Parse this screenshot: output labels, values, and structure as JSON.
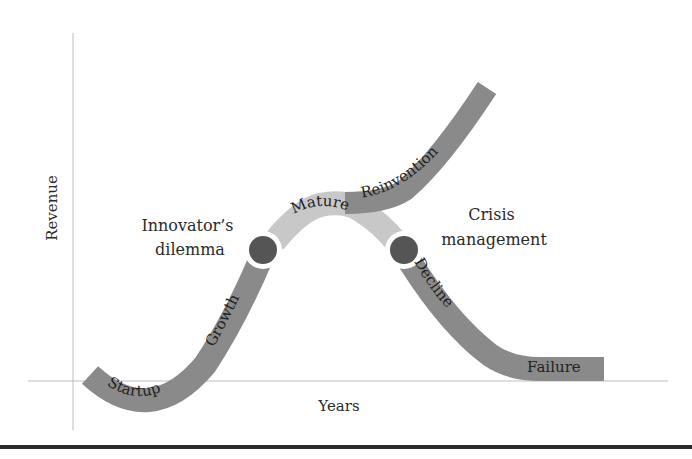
{
  "diagram": {
    "type": "lifecycle-curve",
    "axes": {
      "x_label": "Years",
      "y_label": "Revenue"
    },
    "stages": [
      {
        "id": "startup",
        "label": "Startup"
      },
      {
        "id": "growth",
        "label": "Growth"
      },
      {
        "id": "mature",
        "label": "Mature"
      },
      {
        "id": "reinvention",
        "label": "Reinvention"
      },
      {
        "id": "decline",
        "label": "Decline"
      },
      {
        "id": "failure",
        "label": "Failure"
      }
    ],
    "turning_points": [
      {
        "id": "innovators-dilemma",
        "line1": "Innovator’s",
        "line2": "dilemma"
      },
      {
        "id": "crisis-management",
        "line1": "Crisis",
        "line2": "management"
      }
    ],
    "colors": {
      "dark_band": "#8a8a8a",
      "light_band": "#c8c8c8",
      "node": "#555555",
      "axis": "#bdbdbd",
      "rule": "#2b2b2b"
    }
  }
}
